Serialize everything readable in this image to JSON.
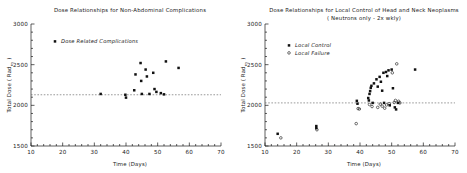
{
  "figure": {
    "background": "#ffffff",
    "ink": "#111111"
  },
  "chart_data": [
    {
      "type": "scatter",
      "panel": "left",
      "title": "Dose Relationships for Non-Abdominal Complications",
      "xlabel": "Time (Days)",
      "ylabel": "Total Dose ( Rad nγ )",
      "ylabel_main": "Total Dose ( Rad",
      "ylabel_sub": "nγ",
      "ylabel_tail": " )",
      "xlim": [
        10,
        70
      ],
      "ylim": [
        1500,
        3000
      ],
      "xticks": [
        10,
        20,
        30,
        40,
        50,
        60,
        70
      ],
      "yticks": [
        1500,
        2000,
        2500,
        3000
      ],
      "xtick_labels": [
        "10",
        "20",
        "30",
        "40",
        "50",
        "60",
        "70"
      ],
      "ytick_labels": [
        "1500",
        "2000",
        "2500",
        "3000"
      ],
      "grid": false,
      "legend_position": "upper-left",
      "reference_line": {
        "y": 2130,
        "style": "dashed",
        "label": ""
      },
      "legend": [
        {
          "label": "Dose Related Complications",
          "marker": "filled-square"
        }
      ],
      "series": [
        {
          "name": "Dose Related Complications",
          "marker": "filled-square",
          "points": [
            {
              "x": 32.0,
              "y": 2140
            },
            {
              "x": 39.8,
              "y": 2130
            },
            {
              "x": 40.0,
              "y": 2095
            },
            {
              "x": 42.6,
              "y": 2185
            },
            {
              "x": 43.0,
              "y": 2380
            },
            {
              "x": 44.6,
              "y": 2520
            },
            {
              "x": 44.8,
              "y": 2300
            },
            {
              "x": 45.0,
              "y": 2140
            },
            {
              "x": 46.2,
              "y": 2440
            },
            {
              "x": 46.6,
              "y": 2355
            },
            {
              "x": 47.4,
              "y": 2140
            },
            {
              "x": 48.6,
              "y": 2400
            },
            {
              "x": 49.0,
              "y": 2200
            },
            {
              "x": 49.6,
              "y": 2165
            },
            {
              "x": 51.0,
              "y": 2150
            },
            {
              "x": 52.0,
              "y": 2135
            },
            {
              "x": 52.6,
              "y": 2540
            },
            {
              "x": 56.6,
              "y": 2460
            }
          ]
        }
      ]
    },
    {
      "type": "scatter",
      "panel": "right",
      "title": "Dose Relationships for Local Control of Head and Neck Neoplasms",
      "subtitle": "( Neutrons only - 2x wkly)",
      "xlabel": "Time (Days)",
      "ylabel": "Total Dose ( Rad nγ )",
      "ylabel_main": "Total Dose ( Rad",
      "ylabel_sub": "nγ",
      "ylabel_tail": " )",
      "xlim": [
        10,
        70
      ],
      "ylim": [
        1500,
        3000
      ],
      "xticks": [
        10,
        20,
        30,
        40,
        50,
        60,
        70
      ],
      "yticks": [
        1500,
        2000,
        2500,
        3000
      ],
      "xtick_labels": [
        "10",
        "20",
        "30",
        "40",
        "50",
        "60",
        "70"
      ],
      "ytick_labels": [
        "1500",
        "2000",
        "2500",
        "3000"
      ],
      "grid": false,
      "legend_position": "upper-left",
      "reference_line": {
        "y": 2030,
        "style": "dashed",
        "label": ""
      },
      "legend": [
        {
          "label": "Local Control",
          "marker": "filled-square"
        },
        {
          "label": "Local Failure",
          "marker": "open-circle"
        }
      ],
      "series": [
        {
          "name": "Local Control",
          "marker": "filled-square",
          "points": [
            {
              "x": 14.0,
              "y": 1650
            },
            {
              "x": 26.2,
              "y": 1745
            },
            {
              "x": 26.2,
              "y": 1720
            },
            {
              "x": 39.0,
              "y": 2055
            },
            {
              "x": 39.2,
              "y": 2020
            },
            {
              "x": 42.6,
              "y": 2090
            },
            {
              "x": 42.8,
              "y": 2060
            },
            {
              "x": 43.0,
              "y": 2140
            },
            {
              "x": 43.2,
              "y": 2175
            },
            {
              "x": 43.4,
              "y": 2215
            },
            {
              "x": 43.6,
              "y": 2240
            },
            {
              "x": 44.0,
              "y": 2030
            },
            {
              "x": 44.4,
              "y": 2270
            },
            {
              "x": 45.2,
              "y": 2320
            },
            {
              "x": 45.6,
              "y": 2230
            },
            {
              "x": 46.2,
              "y": 2350
            },
            {
              "x": 46.6,
              "y": 2290
            },
            {
              "x": 47.0,
              "y": 2180
            },
            {
              "x": 47.4,
              "y": 2400
            },
            {
              "x": 47.6,
              "y": 2030
            },
            {
              "x": 48.2,
              "y": 2410
            },
            {
              "x": 48.6,
              "y": 2360
            },
            {
              "x": 49.0,
              "y": 2430
            },
            {
              "x": 49.4,
              "y": 2000
            },
            {
              "x": 50.0,
              "y": 2440
            },
            {
              "x": 50.4,
              "y": 2210
            },
            {
              "x": 51.0,
              "y": 1975
            },
            {
              "x": 51.4,
              "y": 1950
            },
            {
              "x": 52.0,
              "y": 2030
            },
            {
              "x": 57.4,
              "y": 2440
            }
          ]
        },
        {
          "name": "Local Failure",
          "marker": "open-circle",
          "points": [
            {
              "x": 15.0,
              "y": 1600
            },
            {
              "x": 26.4,
              "y": 1700
            },
            {
              "x": 38.8,
              "y": 1775
            },
            {
              "x": 39.4,
              "y": 1960
            },
            {
              "x": 39.8,
              "y": 1955
            },
            {
              "x": 43.0,
              "y": 2010
            },
            {
              "x": 43.8,
              "y": 1985
            },
            {
              "x": 45.6,
              "y": 1975
            },
            {
              "x": 46.4,
              "y": 2015
            },
            {
              "x": 47.0,
              "y": 1990
            },
            {
              "x": 47.8,
              "y": 1965
            },
            {
              "x": 48.4,
              "y": 2005
            },
            {
              "x": 49.2,
              "y": 2020
            },
            {
              "x": 50.2,
              "y": 2400
            },
            {
              "x": 50.8,
              "y": 2035
            },
            {
              "x": 51.2,
              "y": 2060
            },
            {
              "x": 51.6,
              "y": 2510
            },
            {
              "x": 52.2,
              "y": 2050
            },
            {
              "x": 52.6,
              "y": 2030
            }
          ]
        }
      ]
    }
  ]
}
